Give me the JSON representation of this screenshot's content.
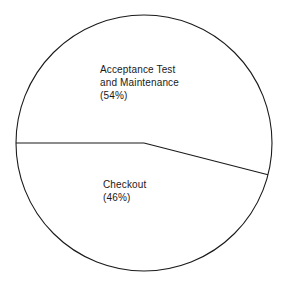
{
  "figure": {
    "background_color": "#ffffff",
    "stroke_color": "#1a1a1a",
    "text_color": "#1a1a1a"
  },
  "labels": {
    "acceptance": {
      "line1": "Acceptance Test",
      "line2": "and Maintenance",
      "line3": "(54%)"
    },
    "checkout": {
      "line1": "Checkout",
      "line2": "(46%)"
    }
  },
  "chart_data": {
    "type": "pie",
    "title": "",
    "subtitle": "",
    "xlabel": "",
    "ylabel": "",
    "legend": "none",
    "grid": false,
    "labels_inside_slices": true,
    "value_format": "percent",
    "categories": [
      "Acceptance Test and Maintenance",
      "Checkout"
    ],
    "values": [
      54,
      46
    ],
    "slices": [
      {
        "name": "Acceptance Test and Maintenance",
        "value": 54,
        "value_label": "(54%)",
        "label_lines": [
          "Acceptance Test",
          "and Maintenance",
          "(54%)"
        ],
        "fill": "none",
        "stroke": "#1a1a1a",
        "start_angle_deg": 180,
        "end_angle_deg": 374.4,
        "sweep_deg": 194.4
      },
      {
        "name": "Checkout",
        "value": 46,
        "value_label": "(46%)",
        "label_lines": [
          "Checkout",
          "(46%)"
        ],
        "fill": "none",
        "stroke": "#1a1a1a",
        "start_angle_deg": 14.4,
        "end_angle_deg": 180,
        "sweep_deg": 165.6
      }
    ],
    "geometry": {
      "center_x": 144,
      "center_y": 143,
      "radius": 128,
      "divider_angles_deg": [
        180,
        14.4
      ]
    }
  }
}
